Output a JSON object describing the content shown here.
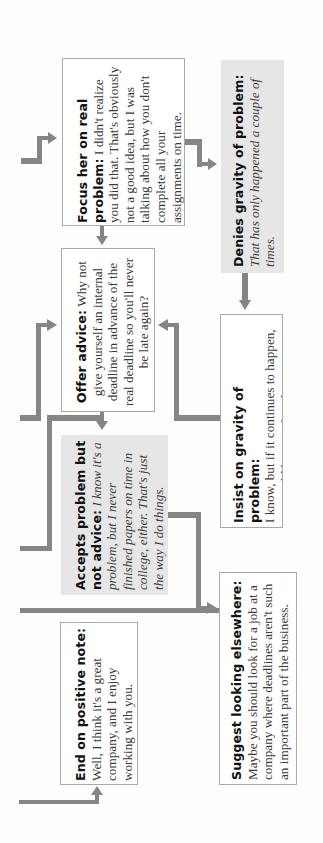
{
  "diagram": {
    "orientation": "rotated-90-ccw",
    "colors": {
      "connector": "#858585",
      "white_box_fill": "#ffffff",
      "gray_box_fill": "#e6e6e6",
      "box_border": "#a9a9a9"
    },
    "nodes": {
      "focus": {
        "label": "Focus her on real problem:",
        "text": "I didn't realize you did that. That's obviously not a good idea, but I was talking about how you don't complete all your assignments on time.",
        "style": "plain"
      },
      "denies": {
        "label": "Denies gravity of problem:",
        "text": "That has only happened a couple of times.",
        "style": "italic"
      },
      "offer": {
        "label": "Offer advice:",
        "text": "Why not give yourself an internal deadline in advance of the real deadline so you'll never be late again?",
        "style": "plain"
      },
      "insist": {
        "label": "Insist on gravity of problem:",
        "text": "I know, but if it continues to happen, you could be out of a job.",
        "style": "plain"
      },
      "accepts": {
        "label": "Accepts problem but not advice:",
        "text": "I know it's a problem, but I never finished papers on time in college, either. That's just the way I do things.",
        "style": "italic"
      },
      "suggest": {
        "label": "Suggest looking elsewhere:",
        "text": "Maybe you should look for a job at a company where deadlines aren't such an important part of the business.",
        "style": "plain"
      },
      "end": {
        "label": "End on positive note:",
        "text": "Well, I think it's a great company, and I enjoy working with you.",
        "style": "plain"
      }
    },
    "edges": [
      {
        "from": "previous",
        "to": "focus"
      },
      {
        "from": "focus",
        "to": "denies"
      },
      {
        "from": "focus",
        "to": "offer"
      },
      {
        "from": "denies",
        "to": "insist"
      },
      {
        "from": "insist",
        "to": "offer"
      },
      {
        "from": "previous",
        "to": "offer"
      },
      {
        "from": "offer",
        "to": "accepts"
      },
      {
        "from": "accepts",
        "to": "suggest"
      },
      {
        "from": "previous",
        "to": "end"
      }
    ]
  }
}
